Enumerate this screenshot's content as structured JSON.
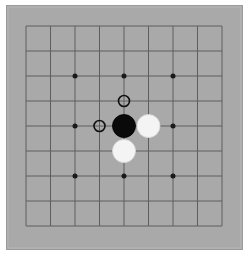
{
  "board": {
    "size": 9,
    "background_color": "#a9a9a9",
    "line_color": "#5e5e5e",
    "star_points": [
      [
        2,
        2
      ],
      [
        4,
        2
      ],
      [
        6,
        2
      ],
      [
        2,
        4
      ],
      [
        6,
        4
      ],
      [
        2,
        6
      ],
      [
        4,
        6
      ],
      [
        6,
        6
      ],
      [
        4,
        4
      ]
    ],
    "stones": [
      {
        "col": 4,
        "row": 4,
        "color": "black"
      },
      {
        "col": 5,
        "row": 4,
        "color": "white"
      },
      {
        "col": 4,
        "row": 5,
        "color": "white"
      }
    ],
    "markers": [
      {
        "col": 4,
        "row": 3,
        "type": "ring"
      },
      {
        "col": 3,
        "row": 4,
        "type": "ring"
      }
    ]
  },
  "colors": {
    "black_stone": "#0a0a0a",
    "white_stone": "#f4f4f4",
    "marker": "#111111"
  }
}
